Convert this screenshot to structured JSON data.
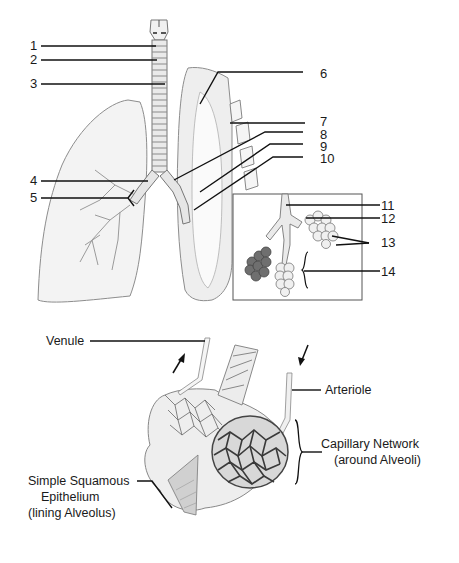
{
  "diagram": {
    "upper_panel": {
      "number_labels": [
        {
          "id": 1,
          "text": "1"
        },
        {
          "id": 2,
          "text": "2"
        },
        {
          "id": 3,
          "text": "3"
        },
        {
          "id": 4,
          "text": "4"
        },
        {
          "id": 5,
          "text": "5"
        },
        {
          "id": 6,
          "text": "6"
        },
        {
          "id": 7,
          "text": "7"
        },
        {
          "id": 8,
          "text": "8"
        },
        {
          "id": 9,
          "text": "9"
        },
        {
          "id": 10,
          "text": "10"
        },
        {
          "id": 11,
          "text": "11"
        },
        {
          "id": 12,
          "text": "12"
        },
        {
          "id": 13,
          "text": "13"
        },
        {
          "id": 14,
          "text": "14"
        }
      ],
      "inset": "Bronchiole, alveolar duct and alveolar sacs"
    },
    "lower_panel": {
      "labels": {
        "venule": "Venule",
        "arteriole": "Arteriole",
        "capillary_line1": "Capillary Network",
        "capillary_line2": "(around Alveoli)",
        "epithelium_line1": "Simple Squamous",
        "epithelium_line2": "Epithelium",
        "epithelium_line3": "(lining Alveolus)"
      }
    },
    "colors": {
      "line": "#111111",
      "organ_fill": "#f2f2f2",
      "organ_stroke": "#8a8a8a",
      "capillary": "#444444"
    }
  }
}
